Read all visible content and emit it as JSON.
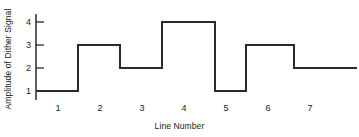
{
  "chart_data": {
    "type": "line",
    "subtype": "step",
    "title": "",
    "xlabel": "Line Number",
    "ylabel": "Amplitude of Dither Signal",
    "categories": [
      1,
      2,
      3,
      4,
      5,
      6,
      7
    ],
    "values": [
      1,
      3,
      2,
      4,
      1,
      3,
      2
    ],
    "series": [
      {
        "name": "Dither Signal",
        "values": [
          1,
          3,
          2,
          4,
          1,
          3,
          2
        ],
        "color": "#1a1a1a",
        "style": "step-post"
      }
    ],
    "dashed_segments": [
      {
        "from_category": 7,
        "note": "final segment drawn dashed to indicate continuation"
      }
    ],
    "xticks": [
      1,
      2,
      3,
      4,
      5,
      6,
      7
    ],
    "xtick_labels": [
      "1",
      "2",
      "3",
      "4",
      "5",
      "6",
      "7"
    ],
    "yticks": [
      1,
      2,
      3,
      4
    ],
    "ytick_labels": [
      "1",
      "2",
      "3",
      "4"
    ],
    "xlim": [
      0.5,
      7.6
    ],
    "ylim": [
      0.6,
      4.5
    ],
    "grid": false,
    "legend": false,
    "legend_position": "none",
    "axis_color": "#1a1a1a",
    "line_color": "#1a1a1a",
    "background": "#ffffff"
  }
}
